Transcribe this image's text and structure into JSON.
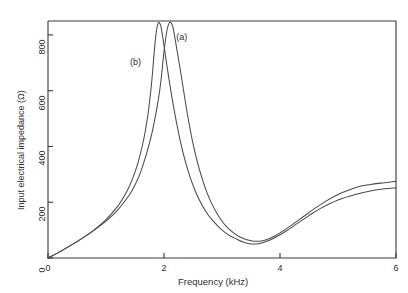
{
  "chart_data": {
    "type": "line",
    "title": "",
    "xlabel": "Frequency (kHz)",
    "ylabel": "Input electrical impedance (Ω)",
    "xlim": [
      0,
      6
    ],
    "ylim": [
      0,
      850
    ],
    "grid": false,
    "legend_position": "inline-annotations",
    "xticks": [
      "0",
      "2",
      "4",
      "6"
    ],
    "xtick_values": [
      0,
      2,
      4,
      6
    ],
    "yticks": [
      "0",
      "200",
      "400",
      "600",
      "800"
    ],
    "ytick_values": [
      0,
      200,
      400,
      600,
      800
    ],
    "annotations": [
      {
        "text": "(a)",
        "x": 2.35,
        "y": 790
      },
      {
        "text": "(b)",
        "x": 1.55,
        "y": 700
      }
    ],
    "series": [
      {
        "name": "(a)",
        "points": [
          [
            0.0,
            0
          ],
          [
            0.2,
            22
          ],
          [
            0.4,
            46
          ],
          [
            0.6,
            72
          ],
          [
            0.8,
            100
          ],
          [
            1.0,
            132
          ],
          [
            1.2,
            172
          ],
          [
            1.4,
            225
          ],
          [
            1.5,
            262
          ],
          [
            1.6,
            310
          ],
          [
            1.7,
            375
          ],
          [
            1.8,
            455
          ],
          [
            1.9,
            565
          ],
          [
            1.95,
            640
          ],
          [
            2.0,
            740
          ],
          [
            2.05,
            815
          ],
          [
            2.1,
            845
          ],
          [
            2.15,
            830
          ],
          [
            2.2,
            775
          ],
          [
            2.3,
            650
          ],
          [
            2.4,
            520
          ],
          [
            2.5,
            410
          ],
          [
            2.6,
            325
          ],
          [
            2.7,
            258
          ],
          [
            2.8,
            205
          ],
          [
            2.9,
            165
          ],
          [
            3.0,
            132
          ],
          [
            3.1,
            108
          ],
          [
            3.2,
            90
          ],
          [
            3.3,
            76
          ],
          [
            3.4,
            67
          ],
          [
            3.5,
            62
          ],
          [
            3.6,
            60
          ],
          [
            3.7,
            62
          ],
          [
            3.8,
            68
          ],
          [
            3.9,
            78
          ],
          [
            4.0,
            90
          ],
          [
            4.2,
            118
          ],
          [
            4.4,
            148
          ],
          [
            4.6,
            178
          ],
          [
            4.8,
            205
          ],
          [
            5.0,
            228
          ],
          [
            5.2,
            245
          ],
          [
            5.4,
            258
          ],
          [
            5.6,
            265
          ],
          [
            5.8,
            270
          ],
          [
            6.0,
            275
          ]
        ]
      },
      {
        "name": "(b)",
        "points": [
          [
            0.0,
            0
          ],
          [
            0.2,
            22
          ],
          [
            0.4,
            46
          ],
          [
            0.6,
            72
          ],
          [
            0.8,
            102
          ],
          [
            1.0,
            138
          ],
          [
            1.2,
            185
          ],
          [
            1.35,
            235
          ],
          [
            1.45,
            280
          ],
          [
            1.55,
            340
          ],
          [
            1.65,
            425
          ],
          [
            1.72,
            510
          ],
          [
            1.78,
            615
          ],
          [
            1.82,
            710
          ],
          [
            1.86,
            800
          ],
          [
            1.9,
            842
          ],
          [
            1.94,
            835
          ],
          [
            1.98,
            790
          ],
          [
            2.05,
            690
          ],
          [
            2.15,
            560
          ],
          [
            2.25,
            450
          ],
          [
            2.35,
            360
          ],
          [
            2.45,
            290
          ],
          [
            2.55,
            235
          ],
          [
            2.65,
            192
          ],
          [
            2.75,
            158
          ],
          [
            2.85,
            132
          ],
          [
            2.95,
            110
          ],
          [
            3.05,
            92
          ],
          [
            3.15,
            78
          ],
          [
            3.25,
            68
          ],
          [
            3.35,
            58
          ],
          [
            3.45,
            52
          ],
          [
            3.55,
            50
          ],
          [
            3.65,
            52
          ],
          [
            3.75,
            58
          ],
          [
            3.9,
            72
          ],
          [
            4.1,
            96
          ],
          [
            4.3,
            124
          ],
          [
            4.5,
            152
          ],
          [
            4.7,
            178
          ],
          [
            5.0,
            208
          ],
          [
            5.3,
            228
          ],
          [
            5.6,
            242
          ],
          [
            5.8,
            248
          ],
          [
            6.0,
            252
          ]
        ]
      }
    ]
  }
}
